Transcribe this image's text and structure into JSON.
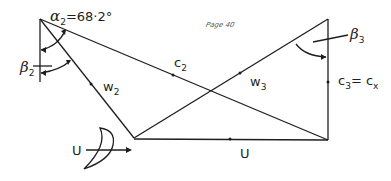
{
  "diagram": {
    "colors": {
      "line": "#1e1e1e",
      "background": "#ffffff"
    },
    "labels": {
      "alpha2_symbol": "α",
      "alpha2_sub": "2",
      "alpha2_value": "=68·2°",
      "beta2_symbol": "β",
      "beta2_sub": "2",
      "beta3_symbol": "β",
      "beta3_sub": "3",
      "c2_main": "c",
      "c2_sub": "2",
      "w2_main": "w",
      "w2_sub": "2",
      "w3_main": "w",
      "w3_sub": "3",
      "c3_main": "c",
      "c3_sub": "3",
      "c3_eq": "= c",
      "cx_sub": "x",
      "u_blade": "U",
      "u_bottom": "U",
      "handwritten_note": "Page 40"
    },
    "icons": [
      "rotor-blade-icon",
      "arrow-right-icon"
    ]
  }
}
